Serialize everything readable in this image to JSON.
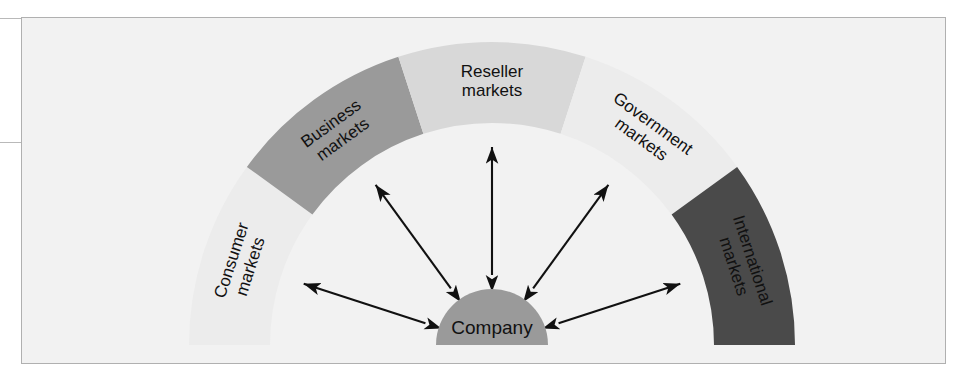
{
  "figure": {
    "background_color": "#f2f2f2",
    "frame_border_color": "#b0b0b0"
  },
  "center": {
    "label": "Company",
    "fill": "#9a9a9a"
  },
  "segments": [
    {
      "id": "consumer",
      "line1": "Consumer",
      "line2": "markets",
      "fill": "#ececec",
      "start_angle": 180,
      "end_angle": 144
    },
    {
      "id": "business",
      "line1": "Business",
      "line2": "markets",
      "fill": "#9a9a9a",
      "start_angle": 144,
      "end_angle": 108
    },
    {
      "id": "reseller",
      "line1": "Reseller",
      "line2": "markets",
      "fill": "#d8d8d8",
      "start_angle": 108,
      "end_angle": 72
    },
    {
      "id": "government",
      "line1": "Government",
      "line2": "markets",
      "fill": "#ececec",
      "start_angle": 72,
      "end_angle": 36
    },
    {
      "id": "international",
      "line1": "International",
      "line2": "markets",
      "fill": "#4a4a4a",
      "start_angle": 36,
      "end_angle": 0
    }
  ],
  "arrows": {
    "color": "#111111",
    "count": 5,
    "description": "double-headed arrows radiating from the company to each market segment",
    "angles": [
      162,
      126,
      90,
      54,
      18
    ]
  }
}
